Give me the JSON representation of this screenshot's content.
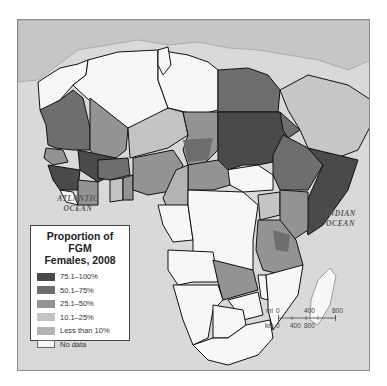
{
  "title": "Proportion of FGM Females, 2008",
  "legend": {
    "title_line1": "Proportion of FGM",
    "title_line2": "Females, 2008",
    "items": [
      {
        "label": "75.1–100%",
        "color": "#4a4a4a"
      },
      {
        "label": "50.1–75%",
        "color": "#6e6e6e"
      },
      {
        "label": "25.1–50%",
        "color": "#939393"
      },
      {
        "label": "10.1–25%",
        "color": "#c4c4c4"
      },
      {
        "label": "Less than 10%",
        "color": "#b3b3b3"
      },
      {
        "label": "No data",
        "color": "#f7f7f7"
      }
    ]
  },
  "oceans": {
    "atlantic_line1": "ATLANTIC",
    "atlantic_line2": "OCEAN",
    "indian_line1": "INDIAN",
    "indian_line2": "OCEAN"
  },
  "scale_bar": {
    "mi_label": "mi",
    "km_label": "km",
    "mi_ticks": [
      "0",
      "400",
      "800"
    ],
    "km_ticks": [
      "0",
      "400",
      "800"
    ]
  },
  "colors": {
    "ocean": "#d9d9d9",
    "non_africa_land": "#c8c8c8",
    "border": "#111111"
  }
}
